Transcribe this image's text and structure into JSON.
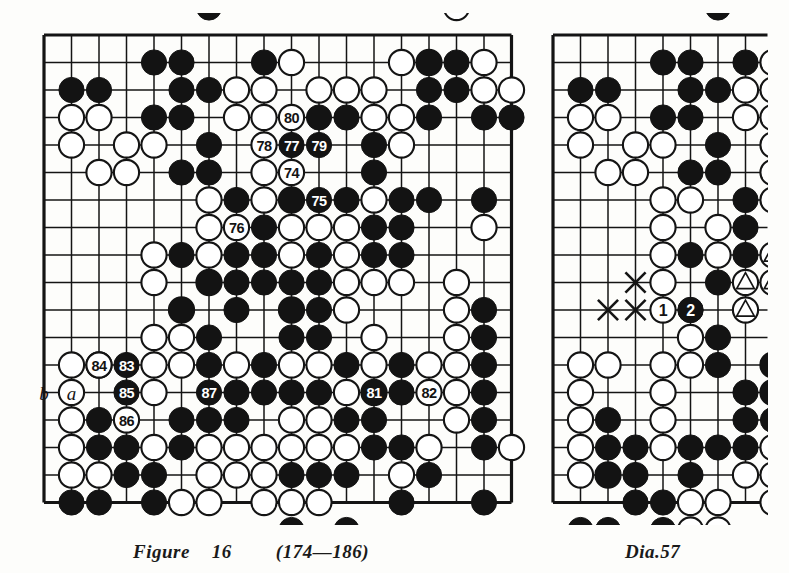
{
  "page": {
    "background": "#fdfdfb",
    "ink": "#111111"
  },
  "figure": {
    "name": "Figure",
    "number": "16",
    "move_range": "(174—186)",
    "caption": "Figure  16    (174—186)"
  },
  "diagram": {
    "caption": "Dia.  57",
    "name": "Dia.",
    "number": "57"
  },
  "left_board": {
    "label": "Figure 16",
    "geometry": {
      "x": 44,
      "y": 35,
      "cols": 18,
      "rows": 18,
      "step": 27.5,
      "stone_r": 12.6
    },
    "edges": {
      "top": true,
      "left": true,
      "right": true,
      "bottom": true
    },
    "star_points": [
      [
        14,
        3
      ]
    ],
    "black_stones": [
      [
        6,
        -1
      ],
      [
        4,
        1
      ],
      [
        5,
        1
      ],
      [
        8,
        1
      ],
      [
        14,
        1
      ],
      [
        15,
        1
      ],
      [
        1,
        2
      ],
      [
        2,
        2
      ],
      [
        5,
        2
      ],
      [
        6,
        2
      ],
      [
        14,
        2
      ],
      [
        15,
        2
      ],
      [
        4,
        3
      ],
      [
        5,
        3
      ],
      [
        10,
        3
      ],
      [
        11,
        3
      ],
      [
        14,
        3
      ],
      [
        16,
        3
      ],
      [
        17,
        3
      ],
      [
        6,
        4
      ],
      [
        12,
        4
      ],
      [
        5,
        5
      ],
      [
        6,
        5
      ],
      [
        12,
        5
      ],
      [
        7,
        6
      ],
      [
        9,
        6
      ],
      [
        11,
        6
      ],
      [
        13,
        6
      ],
      [
        14,
        6
      ],
      [
        16,
        6
      ],
      [
        7,
        7
      ],
      [
        8,
        7
      ],
      [
        12,
        7
      ],
      [
        13,
        7
      ],
      [
        5,
        8
      ],
      [
        7,
        8
      ],
      [
        8,
        8
      ],
      [
        10,
        8
      ],
      [
        12,
        8
      ],
      [
        13,
        8
      ],
      [
        6,
        9
      ],
      [
        7,
        9
      ],
      [
        8,
        9
      ],
      [
        9,
        9
      ],
      [
        10,
        9
      ],
      [
        5,
        10
      ],
      [
        7,
        10
      ],
      [
        9,
        10
      ],
      [
        10,
        10
      ],
      [
        16,
        10
      ],
      [
        6,
        11
      ],
      [
        9,
        11
      ],
      [
        10,
        11
      ],
      [
        16,
        11
      ],
      [
        6,
        12
      ],
      [
        8,
        12
      ],
      [
        11,
        12
      ],
      [
        13,
        12
      ],
      [
        16,
        12
      ],
      [
        7,
        13
      ],
      [
        8,
        13
      ],
      [
        9,
        13
      ],
      [
        10,
        13
      ],
      [
        13,
        13
      ],
      [
        16,
        13
      ],
      [
        2,
        14
      ],
      [
        5,
        14
      ],
      [
        6,
        14
      ],
      [
        7,
        14
      ],
      [
        11,
        14
      ],
      [
        12,
        14
      ],
      [
        16,
        14
      ],
      [
        2,
        15
      ],
      [
        3,
        15
      ],
      [
        5,
        15
      ],
      [
        12,
        15
      ],
      [
        13,
        15
      ],
      [
        16,
        15
      ],
      [
        3,
        16
      ],
      [
        4,
        16
      ],
      [
        9,
        16
      ],
      [
        10,
        16
      ],
      [
        11,
        16
      ],
      [
        14,
        16
      ],
      [
        1,
        17
      ],
      [
        2,
        17
      ],
      [
        4,
        17
      ],
      [
        13,
        17
      ],
      [
        16,
        17
      ],
      [
        9,
        18
      ],
      [
        11,
        18
      ]
    ],
    "white_stones": [
      [
        15,
        -1
      ],
      [
        9,
        1
      ],
      [
        13,
        1
      ],
      [
        14,
        1
      ],
      [
        16,
        1
      ],
      [
        7,
        2
      ],
      [
        8,
        2
      ],
      [
        10,
        2
      ],
      [
        11,
        2
      ],
      [
        12,
        2
      ],
      [
        16,
        2
      ],
      [
        17,
        2
      ],
      [
        1,
        3
      ],
      [
        2,
        3
      ],
      [
        7,
        3
      ],
      [
        8,
        3
      ],
      [
        12,
        3
      ],
      [
        13,
        3
      ],
      [
        1,
        4
      ],
      [
        3,
        4
      ],
      [
        4,
        4
      ],
      [
        13,
        4
      ],
      [
        2,
        5
      ],
      [
        3,
        5
      ],
      [
        8,
        5
      ],
      [
        6,
        6
      ],
      [
        8,
        6
      ],
      [
        9,
        6
      ],
      [
        12,
        6
      ],
      [
        6,
        7
      ],
      [
        9,
        7
      ],
      [
        10,
        7
      ],
      [
        11,
        7
      ],
      [
        16,
        7
      ],
      [
        4,
        8
      ],
      [
        6,
        8
      ],
      [
        9,
        8
      ],
      [
        11,
        8
      ],
      [
        4,
        9
      ],
      [
        6,
        9
      ],
      [
        11,
        9
      ],
      [
        12,
        9
      ],
      [
        13,
        9
      ],
      [
        15,
        9
      ],
      [
        5,
        10
      ],
      [
        9,
        10
      ],
      [
        11,
        10
      ],
      [
        15,
        10
      ],
      [
        5,
        11
      ],
      [
        12,
        11
      ],
      [
        15,
        11
      ],
      [
        4,
        11
      ],
      [
        1,
        12
      ],
      [
        2,
        12
      ],
      [
        4,
        12
      ],
      [
        5,
        12
      ],
      [
        7,
        12
      ],
      [
        9,
        12
      ],
      [
        10,
        12
      ],
      [
        12,
        12
      ],
      [
        14,
        12
      ],
      [
        15,
        12
      ],
      [
        1,
        13
      ],
      [
        4,
        13
      ],
      [
        11,
        13
      ],
      [
        12,
        13
      ],
      [
        15,
        13
      ],
      [
        1,
        14
      ],
      [
        9,
        14
      ],
      [
        10,
        14
      ],
      [
        15,
        14
      ],
      [
        1,
        15
      ],
      [
        4,
        15
      ],
      [
        6,
        15
      ],
      [
        7,
        15
      ],
      [
        8,
        15
      ],
      [
        9,
        15
      ],
      [
        10,
        15
      ],
      [
        11,
        15
      ],
      [
        14,
        15
      ],
      [
        17,
        15
      ],
      [
        1,
        16
      ],
      [
        2,
        16
      ],
      [
        6,
        16
      ],
      [
        7,
        16
      ],
      [
        8,
        16
      ],
      [
        13,
        16
      ],
      [
        5,
        17
      ],
      [
        6,
        17
      ],
      [
        8,
        17
      ],
      [
        9,
        17
      ],
      [
        10,
        17
      ]
    ],
    "numbered_stones": [
      {
        "n": "74",
        "col": 9,
        "row": 5,
        "color": "white"
      },
      {
        "n": "75",
        "col": 10,
        "row": 6,
        "color": "black"
      },
      {
        "n": "76",
        "col": 7,
        "row": 7,
        "color": "white"
      },
      {
        "n": "77",
        "col": 9,
        "row": 4,
        "color": "black"
      },
      {
        "n": "78",
        "col": 8,
        "row": 4,
        "color": "white"
      },
      {
        "n": "79",
        "col": 10,
        "row": 4,
        "color": "black"
      },
      {
        "n": "80",
        "col": 9,
        "row": 3,
        "color": "white"
      },
      {
        "n": "81",
        "col": 12,
        "row": 13,
        "color": "black"
      },
      {
        "n": "82",
        "col": 14,
        "row": 13,
        "color": "white"
      },
      {
        "n": "83",
        "col": 3,
        "row": 12,
        "color": "black"
      },
      {
        "n": "84",
        "col": 2,
        "row": 12,
        "color": "white"
      },
      {
        "n": "85",
        "col": 3,
        "row": 13,
        "color": "black"
      },
      {
        "n": "86",
        "col": 3,
        "row": 14,
        "color": "white"
      },
      {
        "n": "87",
        "col": 6,
        "row": 13,
        "color": "black"
      }
    ],
    "point_labels": [
      {
        "text": "b",
        "col": 0,
        "row": 13
      },
      {
        "text": "a",
        "col": 1,
        "row": 13
      }
    ]
  },
  "right_board": {
    "label": "Dia. 57",
    "geometry": {
      "x": 553,
      "y": 35,
      "cols": 8,
      "rows": 18,
      "step": 27.5,
      "stone_r": 12.6
    },
    "edges": {
      "top": true,
      "left": true,
      "right": false,
      "bottom": true
    },
    "black_stones": [
      [
        6,
        -1
      ],
      [
        4,
        1
      ],
      [
        5,
        1
      ],
      [
        7,
        1
      ],
      [
        1,
        2
      ],
      [
        2,
        2
      ],
      [
        5,
        2
      ],
      [
        6,
        2
      ],
      [
        4,
        3
      ],
      [
        5,
        3
      ],
      [
        6,
        4
      ],
      [
        5,
        5
      ],
      [
        6,
        5
      ],
      [
        7,
        6
      ],
      [
        7,
        7
      ],
      [
        5,
        8
      ],
      [
        7,
        8
      ],
      [
        6,
        9
      ],
      [
        7,
        9
      ],
      [
        5,
        10
      ],
      [
        7,
        10
      ],
      [
        6,
        11
      ],
      [
        6,
        12
      ],
      [
        8,
        12
      ],
      [
        7,
        13
      ],
      [
        8,
        13
      ],
      [
        2,
        14
      ],
      [
        7,
        14
      ],
      [
        8,
        14
      ],
      [
        2,
        15
      ],
      [
        3,
        15
      ],
      [
        5,
        15
      ],
      [
        6,
        15
      ],
      [
        7,
        15
      ],
      [
        2,
        16
      ],
      [
        3,
        16
      ],
      [
        5,
        16
      ],
      [
        3,
        17
      ],
      [
        4,
        17
      ],
      [
        1,
        18
      ],
      [
        2,
        18
      ],
      [
        4,
        18
      ]
    ],
    "white_stones": [
      [
        8,
        1
      ],
      [
        7,
        2
      ],
      [
        8,
        2
      ],
      [
        1,
        3
      ],
      [
        2,
        3
      ],
      [
        7,
        3
      ],
      [
        8,
        3
      ],
      [
        1,
        4
      ],
      [
        3,
        4
      ],
      [
        4,
        4
      ],
      [
        8,
        4
      ],
      [
        2,
        5
      ],
      [
        3,
        5
      ],
      [
        8,
        5
      ],
      [
        4,
        6
      ],
      [
        5,
        6
      ],
      [
        8,
        6
      ],
      [
        4,
        7
      ],
      [
        6,
        7
      ],
      [
        4,
        8
      ],
      [
        6,
        8
      ],
      [
        4,
        9
      ],
      [
        5,
        11
      ],
      [
        1,
        12
      ],
      [
        2,
        12
      ],
      [
        4,
        12
      ],
      [
        5,
        12
      ],
      [
        8,
        12
      ],
      [
        1,
        13
      ],
      [
        4,
        13
      ],
      [
        8,
        13
      ],
      [
        1,
        14
      ],
      [
        4,
        14
      ],
      [
        1,
        15
      ],
      [
        4,
        15
      ],
      [
        8,
        15
      ],
      [
        1,
        16
      ],
      [
        2,
        16
      ],
      [
        7,
        16
      ],
      [
        8,
        16
      ],
      [
        5,
        17
      ],
      [
        6,
        17
      ],
      [
        8,
        17
      ],
      [
        5,
        18
      ],
      [
        6,
        18
      ]
    ],
    "triangle_stones": [
      [
        8,
        8
      ],
      [
        7,
        9
      ],
      [
        8,
        9
      ],
      [
        7,
        10
      ]
    ],
    "cross_marks": [
      [
        3,
        9
      ],
      [
        2,
        10
      ],
      [
        3,
        10
      ]
    ],
    "numbered_stones": [
      {
        "n": "1",
        "col": 4,
        "row": 10,
        "color": "white"
      },
      {
        "n": "2",
        "col": 5,
        "row": 10,
        "color": "black"
      }
    ]
  }
}
